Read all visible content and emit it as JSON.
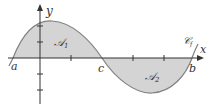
{
  "diagram": {
    "axis_labels": {
      "x": "x",
      "y": "y"
    },
    "points": {
      "a": "a",
      "b": "b",
      "c": "c"
    },
    "regions": [
      {
        "name": "A1",
        "label": "𝒜",
        "sub": "1"
      },
      {
        "name": "A2",
        "label": "𝒜",
        "sub": "2"
      }
    ],
    "curve_label": {
      "main": "𝒞",
      "sub": "f"
    },
    "colors": {
      "fill": "#d4d4d4",
      "curve": "#808080",
      "axis": "#333333"
    }
  }
}
